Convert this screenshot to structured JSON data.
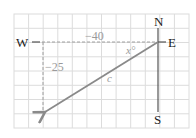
{
  "diagram": {
    "type": "vector-grid",
    "compass": {
      "north": "N",
      "south": "S",
      "east": "E",
      "west": "W"
    },
    "labels": {
      "horizontal_component": "−40",
      "vertical_component": "−25",
      "angle": "x°",
      "resultant": "c"
    },
    "grid": {
      "left": 14,
      "top": 14,
      "right": 189,
      "bottom": 128,
      "columns": 12,
      "rows": 8
    },
    "origin": [
      158,
      42
    ],
    "vector_tip": [
      43,
      113
    ],
    "colors": {
      "grid": "#d9d9d9",
      "axis": "#555555",
      "vector": "#8a8a8a",
      "dashed": "#a0a0a0",
      "compass_text": "#222222",
      "label_text": "#9a9a9a"
    }
  }
}
